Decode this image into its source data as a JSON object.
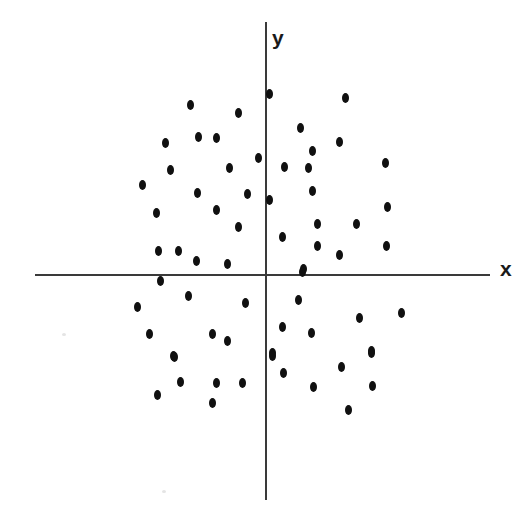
{
  "figure": {
    "width": 531,
    "height": 515,
    "background_color": "#ffffff",
    "point_color": "#101010",
    "axis_color": "#3a3a3a"
  },
  "axes": {
    "x_label": "x",
    "y_label": "y",
    "x_axis": {
      "x1": 35,
      "x2": 490,
      "y": 274
    },
    "y_axis": {
      "x": 265,
      "y1": 22,
      "y2": 500
    },
    "origin": {
      "x": 265,
      "y": 274
    }
  },
  "chart_data": {
    "type": "scatter",
    "title": "",
    "xlabel": "x",
    "ylabel": "y",
    "grid": false,
    "legend": null,
    "axis_style": "centered-cross-through-origin",
    "n_points": 68,
    "note": "Uniform elliptical cloud of points scattered about the origin across all four quadrants; no tick marks, no numeric scale.",
    "pixel_points": [
      [
        190,
        105
      ],
      [
        238,
        113
      ],
      [
        165,
        143
      ],
      [
        198,
        137
      ],
      [
        216,
        138
      ],
      [
        258,
        158
      ],
      [
        170,
        170
      ],
      [
        229,
        168
      ],
      [
        142,
        185
      ],
      [
        197,
        193
      ],
      [
        247,
        194
      ],
      [
        156,
        213
      ],
      [
        216,
        210
      ],
      [
        238,
        227
      ],
      [
        158,
        251
      ],
      [
        178,
        251
      ],
      [
        196,
        261
      ],
      [
        227,
        264
      ],
      [
        269,
        94
      ],
      [
        345,
        98
      ],
      [
        300,
        128
      ],
      [
        312,
        151
      ],
      [
        339,
        142
      ],
      [
        284,
        167
      ],
      [
        308,
        168
      ],
      [
        385,
        163
      ],
      [
        269,
        200
      ],
      [
        312,
        191
      ],
      [
        387,
        207
      ],
      [
        317,
        224
      ],
      [
        356,
        224
      ],
      [
        282,
        237
      ],
      [
        317,
        246
      ],
      [
        386,
        246
      ],
      [
        339,
        255
      ],
      [
        303,
        269
      ],
      [
        160,
        281
      ],
      [
        188,
        296
      ],
      [
        137,
        307
      ],
      [
        245,
        303
      ],
      [
        149,
        334
      ],
      [
        212,
        334
      ],
      [
        227,
        341
      ],
      [
        173,
        356
      ],
      [
        174,
        357
      ],
      [
        180,
        382
      ],
      [
        216,
        383
      ],
      [
        242,
        383
      ],
      [
        157,
        395
      ],
      [
        212,
        403
      ],
      [
        302,
        272
      ],
      [
        298,
        300
      ],
      [
        282,
        327
      ],
      [
        311,
        333
      ],
      [
        359,
        318
      ],
      [
        401,
        313
      ],
      [
        272,
        353
      ],
      [
        371,
        351
      ],
      [
        272,
        356
      ],
      [
        371,
        353
      ],
      [
        283,
        373
      ],
      [
        341,
        367
      ],
      [
        313,
        387
      ],
      [
        372,
        386
      ],
      [
        348,
        410
      ]
    ],
    "quadrant_counts": {
      "upper_left": 18,
      "upper_right": 18,
      "lower_left": 14,
      "lower_right": 15
    }
  },
  "artifacts": {
    "specks": [
      {
        "x": 62,
        "y": 333
      },
      {
        "x": 162,
        "y": 490
      }
    ]
  }
}
